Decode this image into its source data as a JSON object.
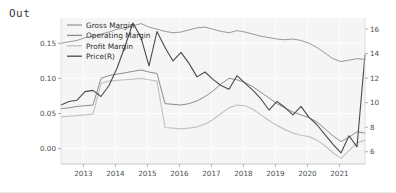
{
  "cell": {
    "prompt_label": "Out"
  },
  "chart_data": {
    "type": "line",
    "title": "",
    "xlabel": "",
    "ylabel": "",
    "y2label": "",
    "grid": true,
    "legend_position": "top-left",
    "plot_background": "#f5f5f5",
    "x": [
      2012.3,
      2012.55,
      2012.8,
      2013.05,
      2013.3,
      2013.55,
      2013.8,
      2014.05,
      2014.3,
      2014.55,
      2014.8,
      2015.05,
      2015.3,
      2015.55,
      2015.8,
      2016.05,
      2016.3,
      2016.55,
      2016.8,
      2017.05,
      2017.3,
      2017.55,
      2017.8,
      2018.05,
      2018.3,
      2018.55,
      2018.8,
      2019.05,
      2019.3,
      2019.55,
      2019.8,
      2020.05,
      2020.3,
      2020.55,
      2020.8,
      2021.05,
      2021.3,
      2021.55,
      2021.8
    ],
    "xticks": [
      2013,
      2014,
      2015,
      2016,
      2017,
      2018,
      2019,
      2020,
      2021
    ],
    "xtick_labels": [
      "2013",
      "2014",
      "2015",
      "2016",
      "2017",
      "2018",
      "2019",
      "2020",
      "2021"
    ],
    "yticks_left": [
      0.0,
      0.05,
      0.1,
      0.15
    ],
    "ytick_labels_left": [
      "0.00",
      "0.05",
      "0.10",
      "0.15"
    ],
    "ylim_left": [
      -0.022,
      0.186
    ],
    "yticks_right": [
      6,
      8,
      10,
      12,
      14,
      16
    ],
    "ytick_labels_right": [
      "6",
      "8",
      "10",
      "12",
      "14",
      "16"
    ],
    "ylim_right": [
      5.0,
      16.9
    ],
    "series": [
      {
        "name": "Gross Margin",
        "axis": "left",
        "color": "#9a9a9a",
        "width": 1.0,
        "values": [
          0.15,
          0.152,
          0.154,
          0.158,
          0.16,
          0.163,
          0.166,
          0.17,
          0.172,
          0.175,
          0.178,
          0.173,
          0.17,
          0.167,
          0.165,
          0.166,
          0.169,
          0.172,
          0.173,
          0.17,
          0.167,
          0.165,
          0.168,
          0.166,
          0.163,
          0.16,
          0.158,
          0.156,
          0.155,
          0.156,
          0.154,
          0.15,
          0.144,
          0.136,
          0.128,
          0.124,
          0.126,
          0.128,
          0.127
        ]
      },
      {
        "name": "Operating Margin",
        "axis": "left",
        "color": "#8d8d8d",
        "width": 1.0,
        "values": [
          0.057,
          0.058,
          0.06,
          0.061,
          0.062,
          0.1,
          0.104,
          0.106,
          0.108,
          0.11,
          0.112,
          0.109,
          0.107,
          0.064,
          0.063,
          0.062,
          0.064,
          0.068,
          0.074,
          0.082,
          0.092,
          0.1,
          0.098,
          0.094,
          0.088,
          0.08,
          0.072,
          0.064,
          0.058,
          0.052,
          0.048,
          0.044,
          0.038,
          0.028,
          0.018,
          0.01,
          0.016,
          0.024,
          0.022
        ]
      },
      {
        "name": "Profit Margin",
        "axis": "left",
        "color": "#c3c3c3",
        "width": 1.2,
        "values": [
          0.045,
          0.046,
          0.047,
          0.048,
          0.049,
          0.093,
          0.096,
          0.097,
          0.098,
          0.099,
          0.1,
          0.098,
          0.096,
          0.03,
          0.029,
          0.028,
          0.029,
          0.031,
          0.035,
          0.041,
          0.05,
          0.058,
          0.062,
          0.061,
          0.056,
          0.048,
          0.04,
          0.033,
          0.027,
          0.022,
          0.019,
          0.017,
          0.012,
          0.004,
          -0.006,
          -0.014,
          -0.003,
          0.008,
          0.012
        ]
      },
      {
        "name": "Price(R)",
        "axis": "right",
        "color": "#4a4a4a",
        "width": 1.1,
        "values": [
          9.8,
          10.1,
          10.2,
          10.9,
          11.0,
          10.5,
          11.4,
          12.8,
          14.6,
          16.5,
          15.3,
          13.0,
          15.8,
          14.5,
          13.4,
          14.1,
          13.2,
          12.1,
          12.5,
          11.9,
          11.4,
          11.1,
          12.2,
          11.6,
          11.0,
          10.3,
          9.4,
          10.1,
          9.6,
          9.0,
          9.7,
          8.8,
          8.2,
          7.4,
          6.6,
          5.9,
          7.3,
          6.4,
          13.9
        ]
      }
    ],
    "legend": [
      {
        "label": "Gross Margin",
        "color": "#9a9a9a"
      },
      {
        "label": "Operating Margin",
        "color": "#8d8d8d"
      },
      {
        "label": "Profit Margin",
        "color": "#c3c3c3"
      },
      {
        "label": "Price(R)",
        "color": "#4a4a4a"
      }
    ]
  }
}
